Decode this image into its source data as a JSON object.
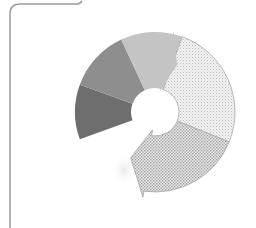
{
  "diagram": {
    "type": "circular-cycle-arrow",
    "frame": {
      "stroke": "#9a9a9a"
    },
    "center": [
      155,
      112
    ],
    "outer_radius": 80,
    "inner_radius": 24,
    "segments": [
      {
        "name": "segment-1",
        "start": 160,
        "end": 200,
        "fill": "#6e6e6e",
        "pattern": "solid"
      },
      {
        "name": "segment-2",
        "start": 200,
        "end": 245,
        "fill": "#8e8e8e",
        "pattern": "solid"
      },
      {
        "name": "segment-3",
        "start": 245,
        "end": 290,
        "fill": "#c4c4c4",
        "pattern": "solid"
      },
      {
        "name": "segment-4",
        "start": 290,
        "end": 22,
        "fill": "#e6e6e6",
        "pattern": "dots-light"
      },
      {
        "name": "segment-5",
        "start": 22,
        "end": 110,
        "fill": "#d0d0d0",
        "pattern": "dots-dense"
      }
    ]
  }
}
